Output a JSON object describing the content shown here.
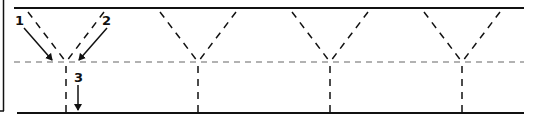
{
  "diagram": {
    "labels": [
      {
        "id": "1",
        "text": "1"
      },
      {
        "id": "2",
        "text": "2"
      },
      {
        "id": "3",
        "text": "3"
      }
    ],
    "num_v_patterns": 4,
    "colors": {
      "line": "#111111",
      "interface": "#999999"
    }
  }
}
